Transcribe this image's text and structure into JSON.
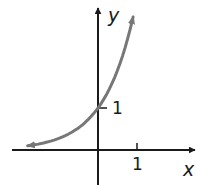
{
  "chart_data": {
    "type": "line",
    "title": "",
    "xlabel": "x",
    "ylabel": "y",
    "x_ticks": [
      {
        "value": 1,
        "label": "1"
      }
    ],
    "y_ticks": [
      {
        "value": 1,
        "label": "1"
      }
    ],
    "xlim": [
      -2.2,
      2.5
    ],
    "ylim": [
      -0.85,
      3.3
    ],
    "grid": false,
    "legend": null,
    "series": [
      {
        "name": "exponential growth curve",
        "function": "y = b^x (b > 1)",
        "base_estimate": 3.6,
        "x": [
          -1.8,
          -1.5,
          -1.0,
          -0.5,
          0.0,
          0.25,
          0.5,
          0.75,
          0.9
        ],
        "y": [
          0.1,
          0.15,
          0.28,
          0.53,
          1.0,
          1.38,
          1.9,
          2.6,
          3.2
        ],
        "y_intercept": 1,
        "horizontal_asymptote": 0,
        "arrows_both_ends": true,
        "color": "#777777"
      }
    ]
  },
  "colors": {
    "axis": "#1a1a1a",
    "curve": "#777777",
    "background": "#ffffff"
  }
}
